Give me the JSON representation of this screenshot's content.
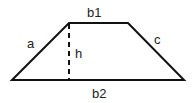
{
  "diagram": {
    "shape": "trapezoid",
    "labels": {
      "top_base": "b1",
      "bottom_base": "b2",
      "left_side": "a",
      "right_side": "c",
      "height": "h"
    },
    "colors": {
      "stroke": "#111111",
      "text": "#222222",
      "background": "#ffffff"
    }
  }
}
